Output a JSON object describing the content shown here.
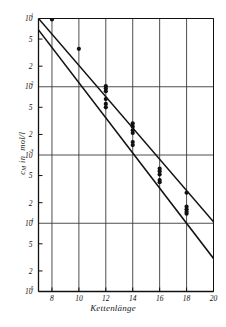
{
  "chart_data": {
    "type": "scatter",
    "title": "",
    "subtitle": "",
    "xlabel": "Kettenlänge",
    "ylabel": "c_M in mol/l",
    "ylabel_parts": {
      "symbol": "c",
      "subscript": "M",
      "middle": "in",
      "unit": "mol/l"
    },
    "xscale": "linear",
    "yscale": "log",
    "xlim": [
      7,
      20
    ],
    "ylim": [
      1e-05,
      0.1
    ],
    "grid": true,
    "grid_style": "major decade horizontal + every-2-unit vertical",
    "legend": "none",
    "xticks": [
      8,
      10,
      12,
      14,
      16,
      18,
      20
    ],
    "xtick_labels": [
      "8",
      "10",
      "12",
      "14",
      "16",
      "18",
      "20"
    ],
    "yticks": [
      0.1,
      0.05,
      0.02,
      0.01,
      0.005,
      0.002,
      0.001,
      0.0005,
      0.0002,
      0.0001,
      5e-05,
      2e-05,
      1e-05
    ],
    "ytick_labels": [
      "10-1",
      "5",
      "2",
      "10-2",
      "5",
      "2",
      "10-3",
      "5",
      "2",
      "10-4",
      "5",
      "2",
      "10-5"
    ],
    "ytick_mantissas": [
      "10",
      "5",
      "2",
      "10",
      "5",
      "2",
      "10",
      "5",
      "2",
      "10",
      "5",
      "2",
      "10"
    ],
    "ytick_exponents": [
      "-1",
      "",
      "",
      "-2",
      "",
      "",
      "-3",
      "",
      "",
      "-4",
      "",
      "",
      "-5"
    ],
    "series": [
      {
        "name": "upper-fit-line",
        "type": "line",
        "points": [
          [
            7.0,
            0.1
          ],
          [
            20.0,
            0.000105
          ]
        ],
        "color": "#111111"
      },
      {
        "name": "lower-fit-line",
        "type": "line",
        "points": [
          [
            7.0,
            0.068
          ],
          [
            20.0,
            3.05e-05
          ]
        ],
        "color": "#111111"
      },
      {
        "name": "measured-points",
        "type": "scatter",
        "marker": "filled-circle",
        "color": "#111111",
        "points": [
          [
            8.0,
            0.097
          ],
          [
            10.0,
            0.036
          ],
          [
            12.0,
            0.0102
          ],
          [
            12.0,
            0.0094
          ],
          [
            12.0,
            0.0086
          ],
          [
            12.0,
            0.0066
          ],
          [
            12.0,
            0.0056
          ],
          [
            12.0,
            0.005
          ],
          [
            14.0,
            0.0029
          ],
          [
            14.0,
            0.0026
          ],
          [
            14.0,
            0.0023
          ],
          [
            14.0,
            0.0021
          ],
          [
            14.0,
            0.00155
          ],
          [
            14.0,
            0.0014
          ],
          [
            16.0,
            0.00063
          ],
          [
            16.0,
            0.00058
          ],
          [
            16.0,
            0.00052
          ],
          [
            16.0,
            0.00043
          ],
          [
            16.0,
            0.0004
          ],
          [
            18.0,
            0.00028
          ],
          [
            18.0,
            0.000175
          ],
          [
            18.0,
            0.00016
          ],
          [
            18.0,
            0.000148
          ],
          [
            18.0,
            0.000138
          ]
        ]
      }
    ]
  },
  "axes": {
    "x_label_text": "Kettenlänge",
    "y_symbol": "c",
    "y_subscript": "M",
    "y_middle": "in",
    "y_unit": "mol/l"
  },
  "colors": {
    "ink": "#111111",
    "grid": "#3a3a3a",
    "background": "#ffffff"
  }
}
